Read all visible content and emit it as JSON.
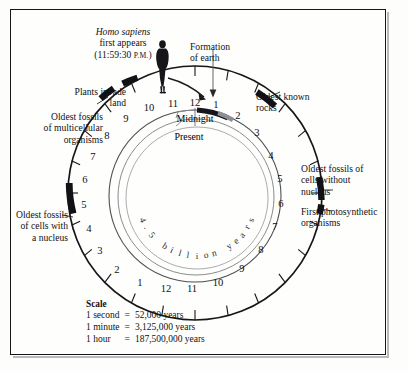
{
  "diagram": {
    "center_text": "4.5 billion years",
    "present_label": "Present",
    "midnight_label": "Midnight",
    "human_figure": "human-silhouette-icon"
  },
  "annotations": {
    "homo_sapiens": {
      "line1": "Homo sapiens",
      "line2": "first appears",
      "line3_open": "(11:59:30 ",
      "line3_smallcaps": "P.M.",
      "line3_close": ")"
    },
    "formation": {
      "line1": "Formation",
      "line2": "of earth"
    },
    "plants": {
      "line1": "Plants invade",
      "line2": "land"
    },
    "multicellular": {
      "line1": "Oldest fossils",
      "line2": "of multicellular",
      "line3": "organisms"
    },
    "nucleus_cells": {
      "line1": "Oldest fossils",
      "line2": "of cells with",
      "line3": "a nucleus"
    },
    "oldest_rocks": {
      "line1": "Oldest known",
      "line2": "rocks"
    },
    "without_nucleus": {
      "line1": "Oldest fossils of",
      "line2": "cells without",
      "line3": "nucleus"
    },
    "photosynthetic": {
      "line1": "First photosynthetic",
      "line2": "organisms"
    }
  },
  "scale": {
    "title": "Scale",
    "rows": [
      {
        "unit": "1 second",
        "eq": "=",
        "value": "52,000 years"
      },
      {
        "unit": "1 minute",
        "eq": "=",
        "value": "3,125,000 years"
      },
      {
        "unit": "1 hour",
        "eq": "=",
        "value": "187,500,000 years"
      }
    ]
  },
  "hour_numbers": [
    "12",
    "1",
    "2",
    "3",
    "4",
    "5",
    "6",
    "7",
    "8",
    "9",
    "10",
    "11",
    "12",
    "1",
    "2",
    "3",
    "4",
    "5",
    "6",
    "7",
    "8",
    "9",
    "10",
    "11"
  ],
  "chart_data": {
    "type": "pie",
    "total_hours": 24,
    "scale_seconds_to_years": 52000,
    "scale_minutes_to_years": 3125000,
    "scale_hours_to_years": 187500000,
    "events": [
      {
        "label": "Formation of earth",
        "clock_hour": 0
      },
      {
        "label": "Oldest known rocks",
        "clock_hour": 2.6
      },
      {
        "label": "Oldest fossils of cells without nucleus",
        "clock_hour": 5.4
      },
      {
        "label": "First photosynthetic organisms",
        "clock_hour": 6.1
      },
      {
        "label": "Oldest fossils of cells with a nucleus",
        "clock_hour": 16.6
      },
      {
        "label": "Oldest fossils of multicellular organisms",
        "clock_hour": 20.7
      },
      {
        "label": "Plants invade land",
        "clock_hour": 21.8
      },
      {
        "label": "Homo sapiens first appears",
        "clock_hour": 23.9917
      }
    ]
  },
  "colors": {
    "ink": "#111114",
    "frame": "#16161a",
    "paper": "#fefefd",
    "marker": "#121216",
    "spiral": "#8b8b90"
  }
}
